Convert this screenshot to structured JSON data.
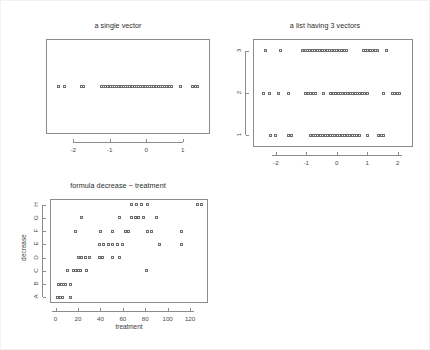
{
  "figure": {
    "background": "#ffffff",
    "frame_color": "#8c8c8c",
    "point_color": "#6e6e6e",
    "text_color": "#2b2b2b"
  },
  "chart_data": [
    {
      "type": "scatter",
      "name": "a-single-vector",
      "title": "a single vector",
      "xlabel": "",
      "ylabel": "",
      "xlim": [
        -2.75,
        1.75
      ],
      "ylim": [
        0,
        1
      ],
      "grid": false,
      "legend": null,
      "xticks": [
        -2,
        -1,
        0,
        1
      ],
      "xticklabels": [
        "-2",
        "-1",
        "0",
        "1"
      ],
      "yticks": [],
      "yticklabels": [],
      "marker": "open-square",
      "series": [
        {
          "name": "x",
          "y": 0.5,
          "values": [
            -2.42,
            -2.24,
            -1.78,
            -1.72,
            -1.23,
            -1.17,
            -1.11,
            -1.05,
            -0.99,
            -0.93,
            -0.87,
            -0.81,
            -0.75,
            -0.69,
            -0.63,
            -0.57,
            -0.51,
            -0.45,
            -0.39,
            -0.33,
            -0.27,
            -0.21,
            -0.15,
            -0.09,
            -0.03,
            0.03,
            0.09,
            0.15,
            0.21,
            0.27,
            0.33,
            0.39,
            0.45,
            0.51,
            0.57,
            0.63,
            0.69,
            0.95,
            1.28,
            1.35,
            1.42
          ]
        }
      ]
    },
    {
      "type": "scatter",
      "name": "a-list-having-3-vectors",
      "title": "a list having 3 vectors",
      "xlabel": "",
      "ylabel": "",
      "xlim": [
        -2.75,
        2.5
      ],
      "grid": false,
      "legend": null,
      "xticks": [
        -2,
        -1,
        0,
        1,
        2
      ],
      "xticklabels": [
        "-2",
        "-1",
        "0",
        "1",
        "2"
      ],
      "yticks": [
        1,
        2,
        3
      ],
      "yticklabels": [
        "1",
        "2",
        "3"
      ],
      "marker": "open-square",
      "series": [
        {
          "name": "3",
          "row": 3,
          "values": [
            -2.35,
            -1.85,
            -1.12,
            -1.04,
            -0.96,
            -0.88,
            -0.8,
            -0.72,
            -0.64,
            -0.56,
            -0.48,
            -0.4,
            -0.32,
            -0.24,
            -0.16,
            -0.08,
            0.0,
            0.08,
            0.16,
            0.24,
            0.32,
            0.86,
            0.94,
            1.02,
            1.1,
            1.18,
            1.26,
            1.34,
            1.62
          ]
        },
        {
          "name": "2",
          "row": 2,
          "values": [
            -2.42,
            -2.22,
            -1.92,
            -1.58,
            -1.02,
            -0.94,
            -0.86,
            -0.78,
            -0.7,
            -0.44,
            -0.2,
            -0.12,
            -0.04,
            0.04,
            0.12,
            0.2,
            0.28,
            0.36,
            0.44,
            0.52,
            0.6,
            0.68,
            0.76,
            0.84,
            0.92,
            1.0,
            1.52,
            1.82,
            1.9,
            1.98,
            2.06
          ]
        },
        {
          "name": "1",
          "row": 1,
          "values": [
            -2.18,
            -2.02,
            -1.58,
            -1.5,
            -0.86,
            -0.78,
            -0.7,
            -0.62,
            -0.54,
            -0.46,
            -0.38,
            -0.3,
            -0.22,
            -0.14,
            -0.06,
            0.02,
            0.1,
            0.18,
            0.26,
            0.34,
            0.42,
            0.5,
            0.58,
            0.66,
            0.74,
            1.02,
            1.38,
            1.46,
            1.54
          ]
        }
      ]
    },
    {
      "type": "scatter",
      "name": "formula-decrease-treatment",
      "title": "formula decrease ~ treatment",
      "xlabel": "treatment",
      "ylabel": "decrease",
      "xlim": [
        -5,
        136
      ],
      "grid": false,
      "legend": null,
      "xticks": [
        0,
        20,
        40,
        60,
        80,
        100,
        120
      ],
      "xticklabels": [
        "0",
        "20",
        "40",
        "60",
        "80",
        "100",
        "120"
      ],
      "yticks": [
        1,
        2,
        3,
        4,
        5,
        6,
        7,
        8
      ],
      "yticklabels": [
        "A",
        "B",
        "C",
        "D",
        "E",
        "F",
        "G",
        "H"
      ],
      "marker": "open-square",
      "series": [
        {
          "name": "H",
          "row": 8,
          "values": [
            68,
            72,
            77,
            82,
            127,
            130
          ]
        },
        {
          "name": "G",
          "row": 7,
          "values": [
            23,
            57,
            68,
            71,
            74,
            78,
            90
          ]
        },
        {
          "name": "F",
          "row": 6,
          "values": [
            18,
            40,
            51,
            62,
            65,
            82,
            86,
            112
          ]
        },
        {
          "name": "E",
          "row": 5,
          "values": [
            39,
            43,
            47,
            51,
            55,
            60,
            93,
            112
          ]
        },
        {
          "name": "D",
          "row": 4,
          "values": [
            20,
            23,
            27,
            30,
            39,
            42,
            51,
            57
          ]
        },
        {
          "name": "C",
          "row": 3,
          "values": [
            11,
            16,
            18,
            20,
            22,
            28,
            81
          ]
        },
        {
          "name": "B",
          "row": 2,
          "values": [
            3,
            5,
            7,
            9,
            13
          ]
        },
        {
          "name": "A",
          "row": 1,
          "values": [
            2,
            4,
            6,
            13
          ]
        }
      ]
    }
  ]
}
